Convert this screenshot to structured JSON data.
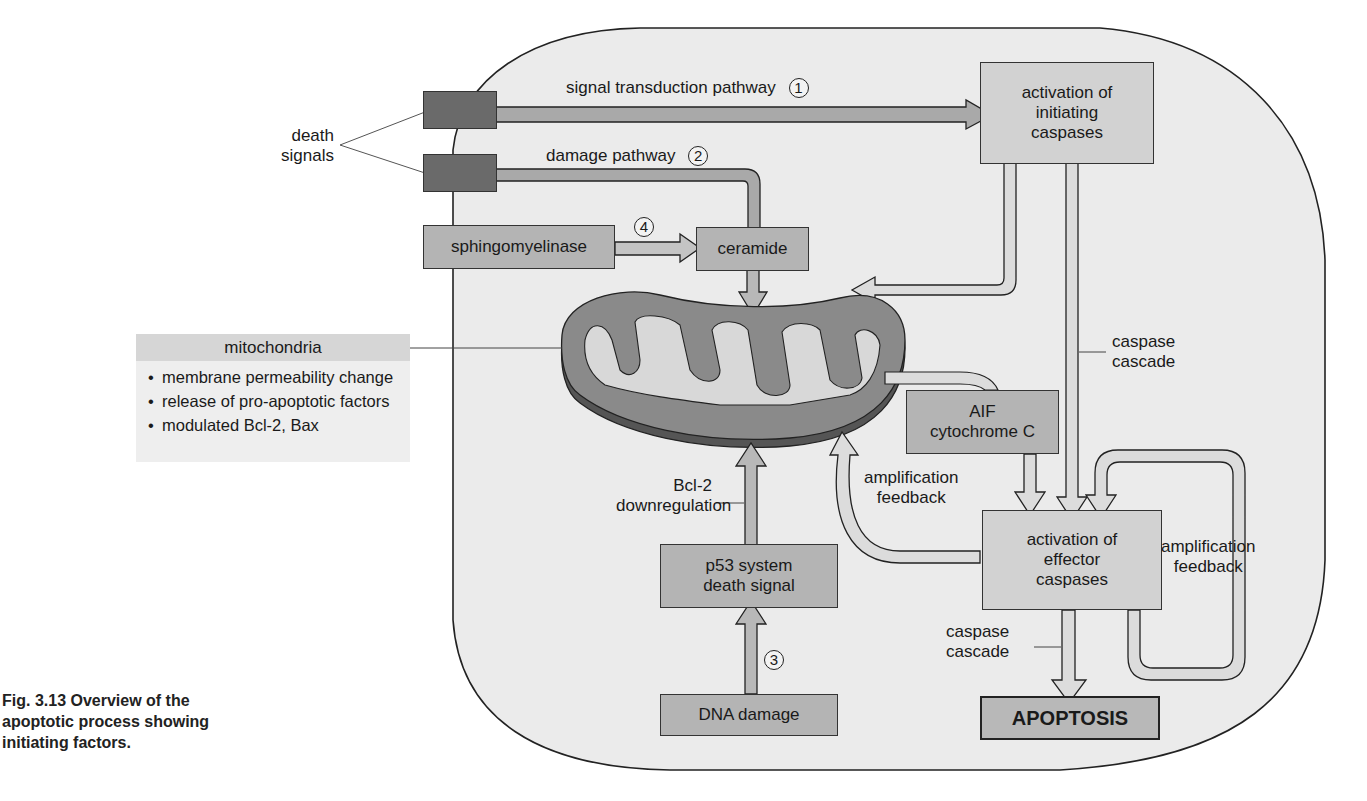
{
  "figure": {
    "caption_lines": [
      "Fig. 3.13  Overview of the",
      "apoptotic process showing",
      "initiating factors."
    ]
  },
  "external": {
    "death_signals_label_lines": [
      "death",
      "signals"
    ]
  },
  "pathways": {
    "signal_transduction": {
      "label": "signal transduction pathway",
      "number": "1"
    },
    "damage": {
      "label": "damage pathway",
      "number": "2"
    },
    "p53": {
      "number": "3"
    },
    "sphingomyelinase": {
      "number": "4"
    }
  },
  "boxes": {
    "initiating_caspases_lines": [
      "activation of",
      "initiating",
      "caspases"
    ],
    "sphingomyelinase": "sphingomyelinase",
    "ceramide": "ceramide",
    "aif_lines": [
      "AIF",
      "cytochrome C"
    ],
    "effector_caspases_lines": [
      "activation of",
      "effector",
      "caspases"
    ],
    "p53_lines": [
      "p53 system",
      "death signal"
    ],
    "dna_damage": "DNA damage",
    "apoptosis": "APOPTOSIS"
  },
  "labels": {
    "caspase_cascade_1_lines": [
      "caspase",
      "cascade"
    ],
    "caspase_cascade_2_lines": [
      "caspase",
      "cascade"
    ],
    "amplification_feedback_left_lines": [
      "amplification",
      "feedback"
    ],
    "amplification_feedback_right_lines": [
      "amplification",
      "feedback"
    ],
    "bcl2_lines": [
      "Bcl-2",
      "downregulation"
    ]
  },
  "mitochondria_info": {
    "title": "mitochondria",
    "items": [
      "membrane permeability change",
      "release of pro-apoptotic factors",
      "modulated Bcl-2, Bax"
    ]
  },
  "colors": {
    "cell_fill": "#ebebeb",
    "box_mid": "#b4b4b4",
    "box_light": "#d2d2d2",
    "box_dark": "#6a6a6a",
    "mito": "#8a8a8a",
    "arrow_fill": "#c8c8c8"
  }
}
